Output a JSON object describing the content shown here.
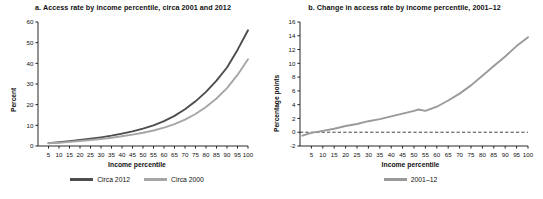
{
  "figure": {
    "panel_a": {
      "title": "a. Access rate by income percentile, circa 2001 and 2012",
      "ylabel": "Percent",
      "xlabel": "Income percentile",
      "legend": [
        {
          "label": "Circa 2012",
          "color": "#4d4d4d"
        },
        {
          "label": "Circa 2000",
          "color": "#a6a6a6"
        }
      ]
    },
    "panel_b": {
      "title": "b. Change in access rate by income percentile, 2001–12",
      "ylabel": "Percentage points",
      "xlabel": "Income percentile",
      "legend": [
        {
          "label": "2001–12",
          "color": "#9a9a9a"
        }
      ]
    }
  },
  "chart_data": [
    {
      "type": "line",
      "panel": "a",
      "title": "a. Access rate by income percentile, circa 2001 and 2012",
      "xlabel": "Income percentile",
      "ylabel": "Percent",
      "xlim": [
        0,
        100
      ],
      "ylim": [
        0,
        60
      ],
      "yticks": [
        0,
        10,
        20,
        30,
        40,
        50,
        60
      ],
      "xticks": [
        5,
        10,
        15,
        20,
        25,
        30,
        35,
        40,
        45,
        50,
        55,
        60,
        65,
        70,
        75,
        80,
        85,
        90,
        95,
        100
      ],
      "grid": false,
      "legend_position": "bottom",
      "x": [
        5,
        10,
        15,
        20,
        25,
        30,
        35,
        40,
        45,
        50,
        55,
        60,
        65,
        70,
        75,
        80,
        85,
        90,
        95,
        100
      ],
      "series": [
        {
          "name": "Circa 2012",
          "color": "#4d4d4d",
          "values": [
            1.4,
            1.8,
            2.3,
            2.9,
            3.5,
            4.2,
            5.0,
            6.0,
            7.1,
            8.4,
            10.0,
            12.0,
            14.6,
            17.8,
            21.6,
            26.2,
            31.6,
            38.0,
            46.5,
            56.0
          ]
        },
        {
          "name": "Circa 2000",
          "color": "#a6a6a6",
          "values": [
            1.3,
            1.6,
            2.0,
            2.4,
            2.9,
            3.4,
            4.0,
            4.7,
            5.5,
            6.4,
            7.5,
            8.9,
            10.6,
            12.8,
            15.5,
            18.9,
            23.0,
            28.0,
            34.4,
            42.0
          ]
        }
      ]
    },
    {
      "type": "line",
      "panel": "b",
      "title": "b. Change in access rate by income percentile, 2001–12",
      "xlabel": "Income percentile",
      "ylabel": "Percentage points",
      "xlim": [
        0,
        100
      ],
      "ylim": [
        -2,
        16
      ],
      "yticks": [
        -2,
        0,
        2,
        4,
        6,
        8,
        10,
        12,
        14,
        16
      ],
      "xticks": [
        5,
        10,
        15,
        20,
        25,
        30,
        35,
        40,
        45,
        50,
        55,
        60,
        65,
        70,
        75,
        80,
        85,
        90,
        95,
        100
      ],
      "grid": false,
      "legend_position": "bottom",
      "zero_reference_line": 0,
      "x": [
        1,
        5,
        10,
        15,
        20,
        25,
        30,
        35,
        40,
        45,
        50,
        52,
        55,
        60,
        65,
        70,
        75,
        80,
        85,
        90,
        95,
        100
      ],
      "series": [
        {
          "name": "2001–12",
          "color": "#9a9a9a",
          "values": [
            -0.5,
            -0.1,
            0.2,
            0.5,
            0.9,
            1.2,
            1.6,
            1.9,
            2.3,
            2.7,
            3.1,
            3.3,
            3.1,
            3.7,
            4.6,
            5.6,
            6.8,
            8.2,
            9.6,
            11.0,
            12.5,
            13.8
          ]
        }
      ]
    }
  ]
}
